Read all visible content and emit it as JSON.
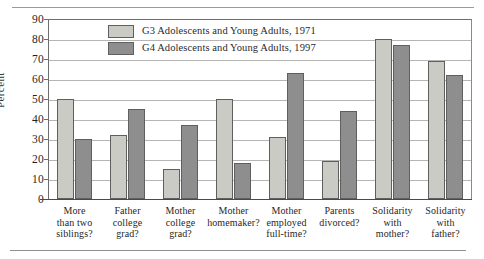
{
  "chart_data": {
    "type": "bar",
    "title": "",
    "xlabel": "",
    "ylabel": "Percent",
    "ylim": [
      0,
      90
    ],
    "yticks": [
      0,
      10,
      20,
      30,
      40,
      50,
      60,
      70,
      80,
      90
    ],
    "grid": true,
    "legend_position": "top-left-inside",
    "categories": [
      "More than two siblings?",
      "Father college grad?",
      "Mother college grad?",
      "Mother homemaker?",
      "Mother employed full-time?",
      "Parents divorced?",
      "Solidarity with mother?",
      "Solidarity with father?"
    ],
    "category_lines": [
      [
        "More",
        "than two",
        "siblings?"
      ],
      [
        "Father",
        "college",
        "grad?"
      ],
      [
        "Mother",
        "college",
        "grad?"
      ],
      [
        "Mother",
        "homemaker?"
      ],
      [
        "Mother",
        "employed",
        "full-time?"
      ],
      [
        "Parents",
        "divorced?"
      ],
      [
        "Solidarity",
        "with",
        "mother?"
      ],
      [
        "Solidarity",
        "with",
        "father?"
      ]
    ],
    "series": [
      {
        "name": "G3 Adolescents and Young Adults, 1971",
        "color": "#cbcbc6",
        "values": [
          50,
          32,
          15,
          50,
          31,
          19,
          80,
          69
        ]
      },
      {
        "name": "G4 Adolescents and Young Adults, 1997",
        "color": "#8e8e8e",
        "values": [
          30,
          45,
          37,
          18,
          63,
          44,
          77,
          62
        ]
      }
    ]
  },
  "legend": {
    "items": [
      {
        "label": "G3 Adolescents and Young Adults, 1971",
        "swatch": "g3"
      },
      {
        "label": "G4 Adolescents and Young Adults, 1997",
        "swatch": "g4"
      }
    ]
  },
  "axis": {
    "y_label": "Percent",
    "y_ticks": [
      "90",
      "80",
      "70",
      "60",
      "50",
      "40",
      "30",
      "20",
      "10",
      "0"
    ]
  }
}
